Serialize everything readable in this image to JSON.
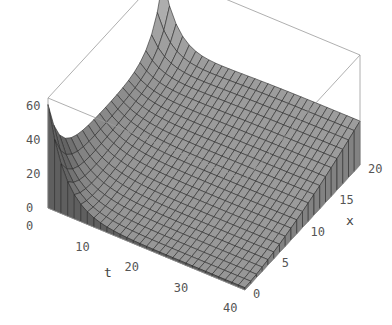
{
  "chart_data": {
    "type": "surface3d",
    "title": "",
    "xlabel": "t",
    "ylabel": "x",
    "zlabel": "",
    "t_range": [
      0,
      40
    ],
    "x_range": [
      0,
      20
    ],
    "z_range": [
      0,
      65
    ],
    "t_ticks": [
      "0",
      "10",
      "20",
      "30",
      "40"
    ],
    "x_ticks": [
      "0",
      "5",
      "10",
      "15",
      "20"
    ],
    "z_ticks": [
      "0",
      "20",
      "40",
      "60"
    ],
    "grid_t_steps": 30,
    "grid_x_steps": 20,
    "surface_description": "Surface near 60 at t=0 (sharp spikes at x=0 and x=20), decaying quickly in t; for larger t the surface rises smoothly with x from ~0 at x=0 toward ~25 at x=20.",
    "face_color": "#8c8c8c",
    "mesh_color": "#2a2a2a",
    "box_color": "#9a9a9a"
  }
}
